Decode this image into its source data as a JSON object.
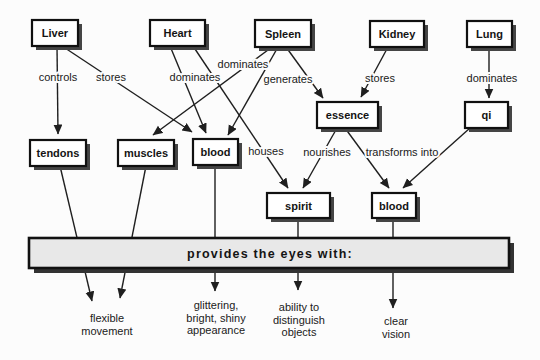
{
  "diagram": {
    "description_colors": {
      "background": "#fcfcfc",
      "line_color": "#1f1f1f",
      "box_fill": "#ffffff",
      "box_border": "#111111",
      "shadow_color": "#454545",
      "bar_fill": "#e8e8e8",
      "bar_shadow": "#333333"
    },
    "nodes": [
      {
        "id": "liver",
        "label": "Liver",
        "x": 32,
        "y": 20,
        "w": 46,
        "h": 26
      },
      {
        "id": "heart",
        "label": "Heart",
        "x": 150,
        "y": 20,
        "w": 55,
        "h": 26
      },
      {
        "id": "spleen",
        "label": "Spleen",
        "x": 255,
        "y": 20,
        "w": 56,
        "h": 27
      },
      {
        "id": "kidney",
        "label": "Kidney",
        "x": 370,
        "y": 21,
        "w": 54,
        "h": 26
      },
      {
        "id": "lung",
        "label": "Lung",
        "x": 467,
        "y": 21,
        "w": 45,
        "h": 26
      },
      {
        "id": "tendons",
        "label": "tendons",
        "x": 30,
        "y": 140,
        "w": 56,
        "h": 26
      },
      {
        "id": "muscles",
        "label": "muscles",
        "x": 118,
        "y": 140,
        "w": 56,
        "h": 26
      },
      {
        "id": "blood-1",
        "label": "blood",
        "x": 193,
        "y": 139,
        "w": 45,
        "h": 26
      },
      {
        "id": "essence",
        "label": "essence",
        "x": 317,
        "y": 102,
        "w": 61,
        "h": 26
      },
      {
        "id": "qi",
        "label": "qi",
        "x": 465,
        "y": 102,
        "w": 43,
        "h": 26
      },
      {
        "id": "spirit",
        "label": "spirit",
        "x": 267,
        "y": 193,
        "w": 63,
        "h": 25
      },
      {
        "id": "blood-2",
        "label": "blood",
        "x": 372,
        "y": 193,
        "w": 44,
        "h": 25
      }
    ],
    "edges": [
      {
        "name": "liver-controls-tendons",
        "x1": 57,
        "y1": 46,
        "x2": 58,
        "y2": 134
      },
      {
        "name": "liver-stores-blood",
        "x1": 62,
        "y1": 46,
        "x2": 192,
        "y2": 132
      },
      {
        "name": "heart-dominates-blood",
        "x1": 170,
        "y1": 46,
        "x2": 206,
        "y2": 133
      },
      {
        "name": "heart-houses-spirit",
        "x1": 193,
        "y1": 46,
        "x2": 288,
        "y2": 188
      },
      {
        "name": "spleen-dominates-muscles",
        "x1": 272,
        "y1": 47,
        "x2": 153,
        "y2": 135
      },
      {
        "name": "spleen-generates-blood",
        "x1": 278,
        "y1": 47,
        "x2": 228,
        "y2": 135
      },
      {
        "name": "spleen-generates-essence",
        "x1": 286,
        "y1": 47,
        "x2": 323,
        "y2": 98
      },
      {
        "name": "kidney-stores-essence",
        "x1": 388,
        "y1": 47,
        "x2": 361,
        "y2": 97
      },
      {
        "name": "lung-dominates-qi",
        "x1": 489,
        "y1": 47,
        "x2": 489,
        "y2": 98
      },
      {
        "name": "essence-nourishes-spirit",
        "x1": 337,
        "y1": 128,
        "x2": 303,
        "y2": 188
      },
      {
        "name": "essence-transforms-blood",
        "x1": 345,
        "y1": 128,
        "x2": 389,
        "y2": 188
      },
      {
        "name": "qi-transforms-blood",
        "x1": 470,
        "y1": 128,
        "x2": 403,
        "y2": 188
      },
      {
        "name": "tendons-to-eyes",
        "x1": 60,
        "y1": 166,
        "x2": 92,
        "y2": 301
      },
      {
        "name": "muscles-to-eyes",
        "x1": 146,
        "y1": 166,
        "x2": 120,
        "y2": 298
      },
      {
        "name": "blood1-to-eyes",
        "x1": 215,
        "y1": 165,
        "x2": 215,
        "y2": 291
      },
      {
        "name": "spirit-to-eyes",
        "x1": 298,
        "y1": 218,
        "x2": 298,
        "y2": 290
      },
      {
        "name": "blood2-to-eyes",
        "x1": 393,
        "y1": 218,
        "x2": 393,
        "y2": 308
      }
    ],
    "edge_labels": [
      {
        "text": "controls",
        "cx": 58,
        "cy": 81
      },
      {
        "text": "stores",
        "cx": 111,
        "cy": 81
      },
      {
        "text": "dominates",
        "cx": 195,
        "cy": 81
      },
      {
        "text": "dominates",
        "cx": 243,
        "cy": 68
      },
      {
        "text": "generates",
        "cx": 288,
        "cy": 83
      },
      {
        "text": "stores",
        "cx": 380,
        "cy": 82
      },
      {
        "text": "dominates",
        "cx": 492,
        "cy": 82
      },
      {
        "text": "houses",
        "cx": 266,
        "cy": 155
      },
      {
        "text": "nourishes",
        "cx": 327,
        "cy": 156
      },
      {
        "text": "transforms into",
        "cx": 402,
        "cy": 156
      }
    ],
    "bar": {
      "label": "provides the eyes with:",
      "x": 29,
      "y": 238,
      "w": 480,
      "h": 30,
      "shadow_dx": 5,
      "shadow_dy": 5
    },
    "captions": [
      {
        "name": "flexible-movement",
        "cx": 107,
        "lines": [
          "flexible",
          "movement"
        ],
        "y0": 322,
        "lh": 13
      },
      {
        "name": "glittering-shiny",
        "cx": 216,
        "lines": [
          "glittering,",
          "bright, shiny",
          "appearance"
        ],
        "y0": 309,
        "lh": 12.7
      },
      {
        "name": "distinguish-objects",
        "cx": 299,
        "lines": [
          "ability to",
          "distinguish",
          "objects"
        ],
        "y0": 311,
        "lh": 12.7
      },
      {
        "name": "clear-vision",
        "cx": 396,
        "lines": [
          "clear",
          "vision"
        ],
        "y0": 325,
        "lh": 13
      }
    ]
  }
}
